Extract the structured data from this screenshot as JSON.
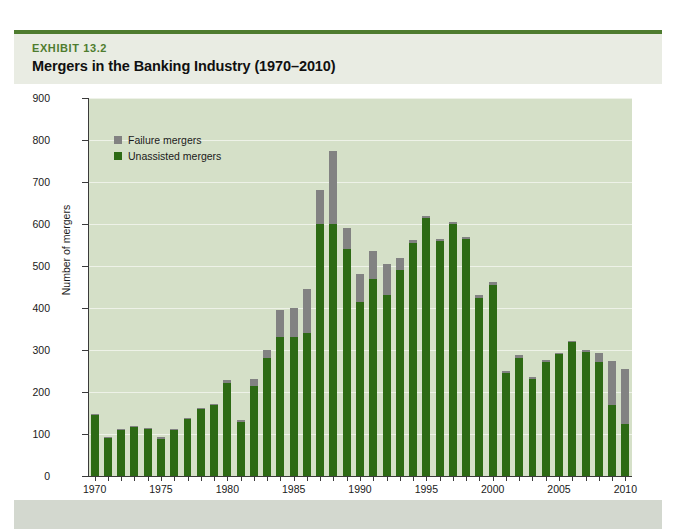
{
  "exhibit": {
    "kicker": "EXHIBIT 13.2",
    "title": "Mergers in the Banking Industry (1970–2010)",
    "accent_color": "#4e7c2f",
    "header_bg": "#e9ece3"
  },
  "legend": {
    "items": [
      {
        "label": "Failure mergers",
        "color": "#828282"
      },
      {
        "label": "Unassisted mergers",
        "color": "#2d6a14"
      }
    ]
  },
  "chart_data": {
    "type": "bar",
    "stacked": true,
    "title": "Mergers in the Banking Industry (1970–2010)",
    "xlabel": "Year",
    "ylabel": "Number of mergers",
    "ylim": [
      0,
      900
    ],
    "ytick_step": 100,
    "yticks": [
      0,
      100,
      200,
      300,
      400,
      500,
      600,
      700,
      800,
      900
    ],
    "xticks": [
      1970,
      1975,
      1980,
      1985,
      1990,
      1995,
      2000,
      2005,
      2010
    ],
    "grid": true,
    "legend_position": "upper left",
    "plot_bg": "#d5e0c8",
    "categories": [
      1970,
      1971,
      1972,
      1973,
      1974,
      1975,
      1976,
      1977,
      1978,
      1979,
      1980,
      1981,
      1982,
      1983,
      1984,
      1985,
      1986,
      1987,
      1988,
      1989,
      1990,
      1991,
      1992,
      1993,
      1994,
      1995,
      1996,
      1997,
      1998,
      1999,
      2000,
      2001,
      2002,
      2003,
      2004,
      2005,
      2006,
      2007,
      2008,
      2009,
      2010
    ],
    "series": [
      {
        "name": "Unassisted mergers",
        "color": "#2d6a14",
        "values": [
          145,
          92,
          110,
          118,
          112,
          88,
          110,
          135,
          160,
          170,
          222,
          128,
          215,
          280,
          330,
          330,
          340,
          600,
          600,
          540,
          415,
          470,
          430,
          490,
          555,
          615,
          560,
          600,
          565,
          425,
          455,
          245,
          282,
          232,
          272,
          290,
          318,
          295,
          272,
          170,
          125
        ]
      },
      {
        "name": "Failure mergers",
        "color": "#828282",
        "values": [
          2,
          2,
          2,
          2,
          2,
          4,
          3,
          2,
          2,
          2,
          6,
          6,
          15,
          20,
          65,
          70,
          105,
          80,
          175,
          50,
          65,
          65,
          75,
          30,
          8,
          5,
          5,
          5,
          5,
          6,
          6,
          4,
          5,
          4,
          4,
          4,
          4,
          4,
          20,
          105,
          130
        ]
      }
    ],
    "totals": [
      147,
      94,
      112,
      120,
      114,
      92,
      113,
      137,
      162,
      172,
      228,
      134,
      230,
      300,
      395,
      400,
      445,
      680,
      775,
      590,
      480,
      535,
      505,
      520,
      563,
      620,
      565,
      605,
      570,
      431,
      461,
      249,
      287,
      236,
      276,
      294,
      322,
      299,
      292,
      275,
      255
    ]
  }
}
